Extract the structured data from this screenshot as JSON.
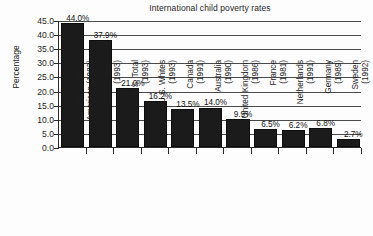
{
  "chart_data": {
    "type": "bar",
    "title": "International child poverty rates",
    "xlabel": "",
    "ylabel": "Percentage",
    "ylim": [
      0.0,
      45.0
    ],
    "ytick_step": 5.0,
    "grid": true,
    "legend": "none",
    "value_label_suffix": "%",
    "ytick_labels": [
      "45.0",
      "40.0",
      "35.0",
      "30.0",
      "25.0",
      "20.0",
      "15.0",
      "10.0",
      "5.0",
      "0.0"
    ],
    "ytick_values": [
      45.0,
      40.0,
      35.0,
      30.0,
      25.0,
      20.0,
      15.0,
      10.0,
      5.0,
      0.0
    ],
    "categories": [
      "U.S. African American (1993)",
      "U.S. Latino (1993)",
      "U.S. Total (1993)",
      "U.S. Whites (1993)",
      "Canada (1991)",
      "Australia (1990)",
      "United Kingdom (1986)",
      "France (1981)",
      "Netherlands (1991)",
      "Germany (1989)",
      "Sweden (1992)"
    ],
    "category_lines": [
      [
        "U.S. African",
        "American (1993)"
      ],
      [
        "U.S. Latino",
        "(1993)"
      ],
      [
        "U.S. Total",
        "(1993)"
      ],
      [
        "U.S. Whites",
        "(1993)"
      ],
      [
        "Canada",
        "(1991)"
      ],
      [
        "Australia",
        "(1990)"
      ],
      [
        "United Kingdom",
        "(1986)"
      ],
      [
        "France",
        "(1981)"
      ],
      [
        "Netherlands",
        "(1991)"
      ],
      [
        "Germany",
        "(1989)"
      ],
      [
        "Sweden",
        "(1992)"
      ]
    ],
    "values": [
      44.0,
      37.9,
      21.0,
      16.2,
      13.5,
      14.0,
      9.9,
      6.5,
      6.2,
      6.8,
      2.7
    ],
    "data_labels": [
      "44.0%",
      "37.9%",
      "21.0%",
      "16.2%",
      "13.5%",
      "14.0%",
      "9.9%",
      "6.5%",
      "6.2%",
      "6.8%",
      "2.7%"
    ],
    "bar_color": "#1b1b1b",
    "background_color": "#fdfdfd",
    "axis_color": "#2a2a2a"
  }
}
